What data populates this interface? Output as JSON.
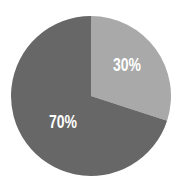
{
  "chart_data": {
    "type": "pie",
    "title": "",
    "categories": [
      "Slice A",
      "Slice B"
    ],
    "values": [
      30,
      70
    ],
    "labels": [
      "30%",
      "70%"
    ],
    "colors": [
      "#a9a9a9",
      "#676767"
    ],
    "start_angle_deg": 0,
    "direction": "clockwise",
    "legend": "none",
    "background": "#ffffff"
  },
  "slices": [
    {
      "label": "30%",
      "value": 30,
      "color": "#a9a9a9"
    },
    {
      "label": "70%",
      "value": 70,
      "color": "#676767"
    }
  ]
}
